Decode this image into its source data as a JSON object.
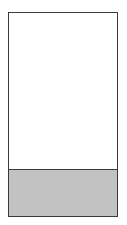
{
  "figure": {
    "type": "rectangle-with-shaded-lower-band",
    "title": "",
    "caption": "",
    "border_color": "#3a3a3a",
    "border_width_px": 1,
    "background_color": "#ffffff",
    "frame": {
      "x": 8,
      "y": 12,
      "width": 110,
      "height": 205
    },
    "regions": [
      {
        "name": "upper-region",
        "label": "",
        "fill_color": "#ffffff",
        "fill_style": "empty",
        "height_px": 156,
        "fraction_of_height": 0.76
      },
      {
        "name": "lower-region",
        "label": "",
        "fill_color": "#c2c2c2",
        "fill_style": "solid-gray",
        "height_px": 47,
        "fraction_of_height": 0.24
      }
    ],
    "divider": {
      "name": "region-divider",
      "orientation": "horizontal",
      "color": "#3a3a3a",
      "thickness_px": 1,
      "y": 169,
      "label": ""
    }
  },
  "canvas": {
    "background_color": "#ffffff",
    "width": 127,
    "height": 225
  }
}
